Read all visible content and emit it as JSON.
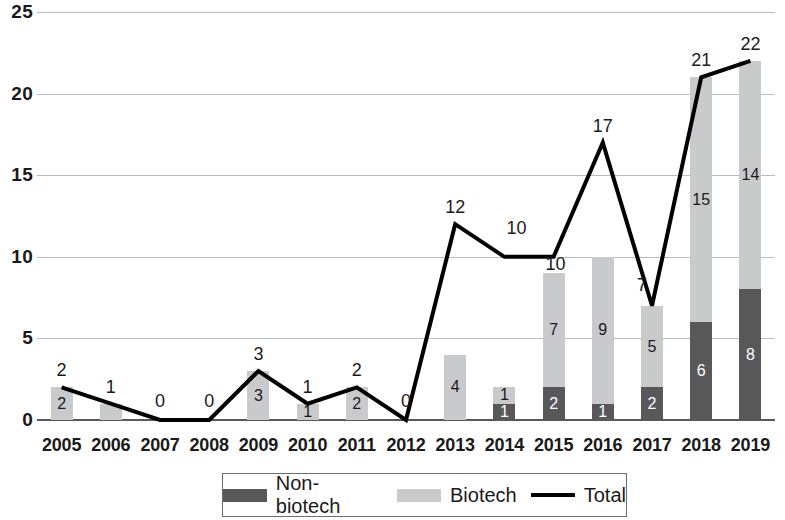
{
  "chart_data": {
    "type": "bar",
    "title": "",
    "subtitle": "",
    "xlabel": "",
    "ylabel": "",
    "ylim": [
      0,
      25
    ],
    "yticks": [
      0,
      5,
      10,
      15,
      20,
      25
    ],
    "grid": true,
    "legend_position": "bottom",
    "categories": [
      "2005",
      "2006",
      "2007",
      "2008",
      "2009",
      "2010",
      "2011",
      "2012",
      "2013",
      "2014",
      "2015",
      "2016",
      "2017",
      "2018",
      "2019"
    ],
    "series": [
      {
        "name": "Non-biotech",
        "kind": "bar-segment",
        "color": "#58585b",
        "values": [
          0,
          0,
          0,
          0,
          0,
          0,
          0,
          0,
          0,
          1,
          2,
          1,
          2,
          6,
          8
        ],
        "labels": [
          "",
          "",
          "",
          "",
          "",
          "",
          "",
          "",
          "",
          "1",
          "2",
          "1",
          "2",
          "6",
          "8"
        ]
      },
      {
        "name": "Biotech",
        "kind": "bar-segment",
        "color": "#c9cacb",
        "values": [
          2,
          1,
          0,
          0,
          3,
          1,
          2,
          0,
          4,
          1,
          7,
          9,
          5,
          15,
          14
        ],
        "labels": [
          "2",
          "",
          "",
          "",
          "3",
          "1",
          "2",
          "",
          "4",
          "1",
          "7",
          "9",
          "5",
          "15",
          "14"
        ]
      },
      {
        "name": "Total",
        "kind": "line",
        "color": "#000000",
        "values": [
          2,
          1,
          0,
          0,
          3,
          1,
          2,
          0,
          12,
          10,
          10,
          17,
          7,
          21,
          22
        ],
        "labels": [
          "2",
          "1",
          "0",
          "0",
          "3",
          "1",
          "2",
          "0",
          "12",
          "10",
          "10",
          "17",
          "7",
          "21",
          "22"
        ]
      }
    ]
  },
  "legend": {
    "items": [
      {
        "label": "Non-biotech",
        "swatch": "nonbio"
      },
      {
        "label": "Biotech",
        "swatch": "bio"
      },
      {
        "label": "Total",
        "swatch": "line"
      }
    ]
  }
}
